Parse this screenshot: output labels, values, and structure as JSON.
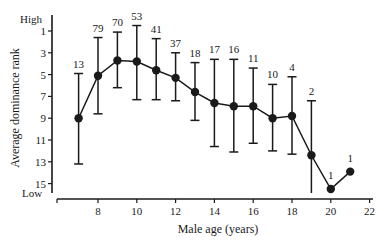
{
  "chart_data": {
    "type": "line",
    "title": "",
    "xlabel": "Male age (years)",
    "ylabel": "Average dominance rank",
    "y_high_label": "High",
    "y_low_label": "Low",
    "y_inverted": true,
    "xlim": [
      6,
      22
    ],
    "ylim": [
      16,
      0
    ],
    "xticks": [
      8,
      10,
      12,
      14,
      16,
      18,
      20,
      22
    ],
    "yticks": [
      1,
      3,
      5,
      7,
      9,
      11,
      13,
      15
    ],
    "grid": false,
    "legend": null,
    "error_bars": true,
    "series": [
      {
        "name": "Average dominance rank",
        "points": [
          {
            "x": 7,
            "y": 9.0,
            "lower": 13.2,
            "upper": 4.9,
            "n": 13
          },
          {
            "x": 8,
            "y": 5.1,
            "lower": 8.6,
            "upper": 1.6,
            "n": 79
          },
          {
            "x": 9,
            "y": 3.7,
            "lower": 6.2,
            "upper": 1.1,
            "n": 70
          },
          {
            "x": 10,
            "y": 3.8,
            "lower": 7.3,
            "upper": 0.5,
            "n": 53
          },
          {
            "x": 11,
            "y": 4.6,
            "lower": 7.3,
            "upper": 1.7,
            "n": 41
          },
          {
            "x": 12,
            "y": 5.3,
            "lower": 7.4,
            "upper": 3.0,
            "n": 37
          },
          {
            "x": 13,
            "y": 6.6,
            "lower": 9.2,
            "upper": 3.9,
            "n": 18
          },
          {
            "x": 14,
            "y": 7.6,
            "lower": 11.6,
            "upper": 3.6,
            "n": 17
          },
          {
            "x": 15,
            "y": 7.9,
            "lower": 12.1,
            "upper": 3.6,
            "n": 16
          },
          {
            "x": 16,
            "y": 7.9,
            "lower": 11.3,
            "upper": 4.4,
            "n": 11
          },
          {
            "x": 17,
            "y": 9.0,
            "lower": 12.0,
            "upper": 5.9,
            "n": 10
          },
          {
            "x": 18,
            "y": 8.8,
            "lower": 12.3,
            "upper": 5.2,
            "n": 4
          },
          {
            "x": 19,
            "y": 12.4,
            "lower": 15.9,
            "upper": 7.4,
            "n": 2
          },
          {
            "x": 20,
            "y": 15.5,
            "lower": null,
            "upper": null,
            "n": 1
          },
          {
            "x": 21,
            "y": 13.9,
            "lower": null,
            "upper": null,
            "n": 1
          }
        ]
      }
    ]
  },
  "colors": {
    "ink": "#1a1a1a",
    "background": "#ffffff"
  }
}
